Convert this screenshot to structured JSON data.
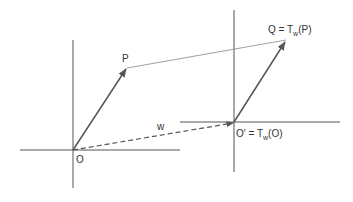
{
  "diagram": {
    "labels": {
      "origin": "O",
      "point_p": "P",
      "vector_w": "w",
      "point_q_prefix": "Q = T",
      "point_q_sub": "w",
      "point_q_suffix": "(P)",
      "origin_prime_prefix": "O' = T",
      "origin_prime_sub": "w",
      "origin_prime_suffix": "(O)"
    },
    "colors": {
      "axis": "#555555",
      "vector": "#555555",
      "connector": "#888888",
      "text": "#333333"
    }
  }
}
